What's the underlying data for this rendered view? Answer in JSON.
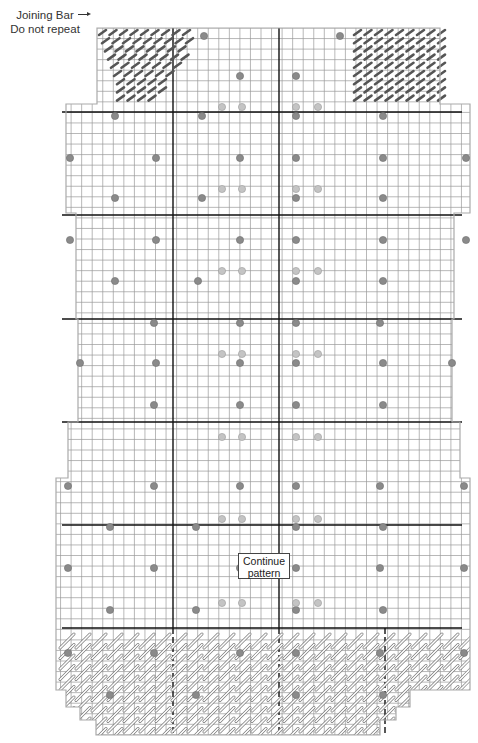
{
  "annotations": {
    "joining_bar_line1": "Joining Bar",
    "joining_bar_line2": "Do not repeat",
    "continue_line1": "Continue",
    "continue_line2": "pattern"
  },
  "colors": {
    "grid_thin": "#9a9a9a",
    "grid_thick": "#111111",
    "outline": "#aaaaaa",
    "bead_dark": "#8a8a8a",
    "bead_light": "#c4c4c4",
    "stitch_dark": "#555555"
  },
  "grid": {
    "cell": 10.55,
    "x0": 68,
    "cols": 38,
    "y0": 28,
    "rows": 67,
    "thick_x": [
      173,
      279
    ],
    "thick_y": [
      112,
      215,
      319,
      422,
      525,
      628
    ],
    "dashed_x": [
      173,
      279,
      385
    ]
  },
  "outline_left": [
    [
      97,
      28
    ],
    [
      97,
      104
    ],
    [
      66,
      104
    ],
    [
      66,
      213
    ],
    [
      76,
      213
    ],
    [
      76,
      319
    ],
    [
      78,
      319
    ],
    [
      78,
      422
    ],
    [
      68,
      422
    ],
    [
      68,
      478
    ],
    [
      56,
      478
    ],
    [
      56,
      690
    ],
    [
      66,
      690
    ],
    [
      66,
      707
    ],
    [
      80,
      707
    ],
    [
      80,
      720
    ],
    [
      96,
      720
    ],
    [
      96,
      735
    ],
    [
      380,
      735
    ],
    [
      380,
      720
    ],
    [
      396,
      720
    ],
    [
      396,
      707
    ],
    [
      410,
      707
    ],
    [
      410,
      690
    ],
    [
      470,
      690
    ],
    [
      470,
      478
    ],
    [
      460,
      478
    ],
    [
      460,
      422
    ],
    [
      452,
      422
    ],
    [
      452,
      319
    ],
    [
      454,
      319
    ],
    [
      454,
      213
    ],
    [
      470,
      213
    ],
    [
      470,
      104
    ],
    [
      440,
      104
    ],
    [
      440,
      28
    ]
  ],
  "beads_dark": [
    [
      204,
      36
    ],
    [
      340,
      36
    ],
    [
      240,
      76
    ],
    [
      296,
      76
    ],
    [
      115,
      116
    ],
    [
      202,
      116
    ],
    [
      296,
      116
    ],
    [
      383,
      116
    ],
    [
      70,
      158
    ],
    [
      156,
      158
    ],
    [
      240,
      158
    ],
    [
      296,
      158
    ],
    [
      383,
      158
    ],
    [
      466,
      158
    ],
    [
      115,
      198
    ],
    [
      202,
      198
    ],
    [
      296,
      198
    ],
    [
      383,
      198
    ],
    [
      70,
      240
    ],
    [
      156,
      240
    ],
    [
      240,
      240
    ],
    [
      296,
      240
    ],
    [
      383,
      240
    ],
    [
      466,
      240
    ],
    [
      115,
      281
    ],
    [
      198,
      281
    ],
    [
      296,
      281
    ],
    [
      383,
      281
    ],
    [
      154,
      323
    ],
    [
      240,
      323
    ],
    [
      296,
      323
    ],
    [
      380,
      323
    ],
    [
      80,
      363
    ],
    [
      156,
      363
    ],
    [
      240,
      363
    ],
    [
      296,
      363
    ],
    [
      383,
      363
    ],
    [
      452,
      363
    ],
    [
      154,
      405
    ],
    [
      240,
      405
    ],
    [
      296,
      405
    ],
    [
      383,
      405
    ],
    [
      68,
      486
    ],
    [
      154,
      486
    ],
    [
      240,
      486
    ],
    [
      296,
      486
    ],
    [
      380,
      486
    ],
    [
      464,
      486
    ],
    [
      110,
      527
    ],
    [
      196,
      527
    ],
    [
      296,
      527
    ],
    [
      383,
      527
    ],
    [
      68,
      568
    ],
    [
      154,
      568
    ],
    [
      240,
      568
    ],
    [
      296,
      568
    ],
    [
      380,
      568
    ],
    [
      464,
      568
    ],
    [
      110,
      610
    ],
    [
      196,
      610
    ],
    [
      296,
      610
    ],
    [
      383,
      610
    ],
    [
      68,
      653
    ],
    [
      154,
      653
    ],
    [
      240,
      653
    ],
    [
      296,
      653
    ],
    [
      380,
      653
    ],
    [
      464,
      653
    ],
    [
      110,
      695
    ],
    [
      196,
      695
    ],
    [
      296,
      695
    ],
    [
      383,
      695
    ]
  ],
  "beads_light": [
    [
      222,
      107
    ],
    [
      242,
      107
    ],
    [
      296,
      107
    ],
    [
      318,
      107
    ],
    [
      222,
      189
    ],
    [
      242,
      189
    ],
    [
      296,
      189
    ],
    [
      318,
      189
    ],
    [
      222,
      271
    ],
    [
      242,
      271
    ],
    [
      296,
      271
    ],
    [
      318,
      271
    ],
    [
      222,
      354
    ],
    [
      242,
      354
    ],
    [
      296,
      354
    ],
    [
      318,
      354
    ],
    [
      222,
      437
    ],
    [
      242,
      437
    ],
    [
      296,
      437
    ],
    [
      318,
      437
    ],
    [
      222,
      519
    ],
    [
      242,
      519
    ],
    [
      296,
      519
    ],
    [
      318,
      519
    ],
    [
      222,
      603
    ],
    [
      242,
      603
    ],
    [
      296,
      603
    ],
    [
      318,
      603
    ]
  ],
  "joining_bar_regions": [
    {
      "x": 97,
      "y": 28,
      "w": 90,
      "h": 74
    },
    {
      "x": 352,
      "y": 28,
      "w": 88,
      "h": 74
    }
  ],
  "bottom_band": {
    "y": 628,
    "h": 105
  }
}
